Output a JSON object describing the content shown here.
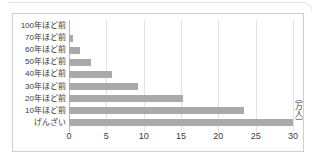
{
  "chart_data": {
    "type": "bar",
    "orientation": "horizontal",
    "title": "",
    "xlabel": "",
    "ylabel": "",
    "unit_label": "（万人）",
    "xlim": [
      0,
      30
    ],
    "ticks": [
      0,
      5,
      10,
      15,
      20,
      25,
      30
    ],
    "tick_labels": [
      "0",
      "5",
      "10",
      "15",
      "20",
      "25",
      "30"
    ],
    "grid": true,
    "legend": "none",
    "bar_color": "#aaaaaa",
    "axis_color": "#b9b9b9",
    "grid_color": "#e4e4e4",
    "border_color": "#cfcfcf",
    "text_color": "#3c3c3c",
    "categories": [
      "100年ほど前",
      "70年ほど前",
      "60年ほど前",
      "50年ほど前",
      "40年ほど前",
      "30年ほど前",
      "20年ほど前",
      "10年ほど前",
      "げんざい"
    ],
    "values": [
      0,
      0.6,
      1.5,
      3.0,
      5.7,
      9.3,
      15.3,
      23.5,
      30.0
    ]
  }
}
